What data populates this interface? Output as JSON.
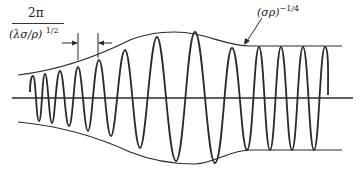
{
  "figure": {
    "type": "wave-packet-envelope-diagram",
    "wavelength_label": {
      "numerator": "2π",
      "denominator": "(λσ/ρ)",
      "denominator_exponent": "1/2"
    },
    "envelope_label": {
      "base": "(σρ)",
      "exponent": "−1/4"
    },
    "colors": {
      "line": "#2a2a2a",
      "background": "#ffffff"
    }
  }
}
